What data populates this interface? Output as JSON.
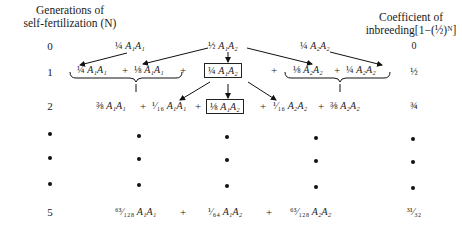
{
  "headers": {
    "left_line1": "Generations of",
    "left_line2": "self-fertilization (N)",
    "right_line1": "Coefficient of",
    "right_line2": "inbreeding[1−(½)ᴺ]"
  },
  "rows": [
    {
      "generation": "0",
      "coefficient": "0",
      "terms": [
        {
          "coef": "¼",
          "genotype": "A₁A₁"
        },
        {
          "coef": "½",
          "genotype": "A₁A₂"
        },
        {
          "coef": "¼",
          "genotype": "A₂A₂"
        }
      ]
    },
    {
      "generation": "1",
      "coefficient": "½",
      "terms": [
        {
          "coef": "¼",
          "genotype": "A₁A₁"
        },
        {
          "coef": "⅛",
          "genotype": "A₁A₁"
        },
        {
          "coef": "¼",
          "genotype": "A₁A₂",
          "boxed": true
        },
        {
          "coef": "⅛",
          "genotype": "A₂A₂"
        },
        {
          "coef": "¼",
          "genotype": "A₂A₂"
        }
      ],
      "operators": [
        "+",
        "+",
        "+",
        "+"
      ]
    },
    {
      "generation": "2",
      "coefficient": "¾",
      "terms": [
        {
          "coef": "⅜",
          "genotype": "A₁A₁"
        },
        {
          "coef": "¹⁄₁₆",
          "genotype": "A₁A₁"
        },
        {
          "coef": "⅛",
          "genotype": "A₁A₂",
          "boxed": true
        },
        {
          "coef": "¹⁄₁₆",
          "genotype": "A₂A₂"
        },
        {
          "coef": "⅜",
          "genotype": "A₂A₂"
        }
      ],
      "operators": [
        "+",
        "+",
        "+",
        "+"
      ]
    },
    {
      "generation": "•",
      "coefficient": "•",
      "ellipsis": true
    },
    {
      "generation": "•",
      "coefficient": "•",
      "ellipsis": true
    },
    {
      "generation": "•",
      "coefficient": "•",
      "ellipsis": true
    },
    {
      "generation": "5",
      "coefficient": "³¹⁄₃₂",
      "terms": [
        {
          "coef": "⁶³⁄₁₂₈",
          "genotype": "A₁A₁"
        },
        {
          "coef": "¹⁄₆₄",
          "genotype": "A₁A₂"
        },
        {
          "coef": "⁶³⁄₁₂₈",
          "genotype": "A₂A₂"
        }
      ],
      "operators": [
        "+",
        "+"
      ]
    }
  ]
}
